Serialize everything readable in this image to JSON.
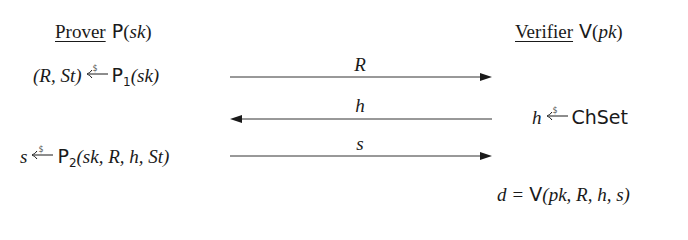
{
  "prover": {
    "role": "Prover",
    "algo": "P",
    "arg": "sk",
    "step1": {
      "lhs": "(R, St)",
      "algo": "P",
      "sub": "1",
      "args": "(sk)"
    },
    "step2": {
      "lhs": "s",
      "algo": "P",
      "sub": "2",
      "args": "(sk, R, h, St)"
    }
  },
  "verifier": {
    "role": "Verifier",
    "algo": "V",
    "arg": "pk",
    "step1": {
      "lhs": "h",
      "set": "ChSet"
    },
    "step2": {
      "lhs": "d",
      "eq": "=",
      "algo": "V",
      "args": "(pk, R, h, s)"
    }
  },
  "messages": [
    {
      "label": "R",
      "direction": "right"
    },
    {
      "label": "h",
      "direction": "left"
    },
    {
      "label": "s",
      "direction": "right"
    }
  ],
  "sample_marker": "$",
  "colors": {
    "ink": "#1a1a1a",
    "arrow": "#333333"
  }
}
